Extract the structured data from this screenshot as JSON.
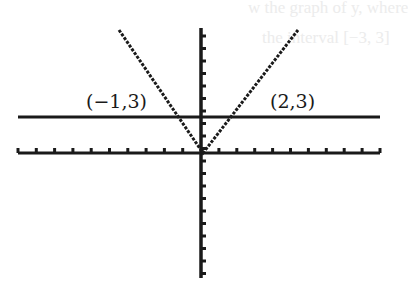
{
  "chart_data": {
    "type": "line",
    "title": "",
    "xlabel": "",
    "ylabel": "",
    "xlim": [
      -10,
      10
    ],
    "ylim": [
      -4,
      4
    ],
    "grid": false,
    "legend": null,
    "x_ticks_per_side": 10,
    "series": [
      {
        "name": "y = 3|x| style V (through (-1,3) and (2,3))",
        "kind": "piecewise",
        "points": [
          [
            -1.4,
            4
          ],
          [
            0,
            0
          ],
          [
            2.8,
            4
          ]
        ]
      },
      {
        "name": "y = 3",
        "kind": "horizontal",
        "points": [
          [
            -10,
            3
          ],
          [
            10,
            3
          ]
        ]
      }
    ],
    "annotations": [
      {
        "text": "(−1,3)",
        "x": -1,
        "y": 3
      },
      {
        "text": "(2,3)",
        "x": 2,
        "y": 3
      }
    ]
  },
  "labels": {
    "left_point": "(−1,3)",
    "right_point": "(2,3)"
  },
  "bleed_text": {
    "line1": "w the graph of y, where",
    "line2": "the interval [−3, 3]"
  }
}
